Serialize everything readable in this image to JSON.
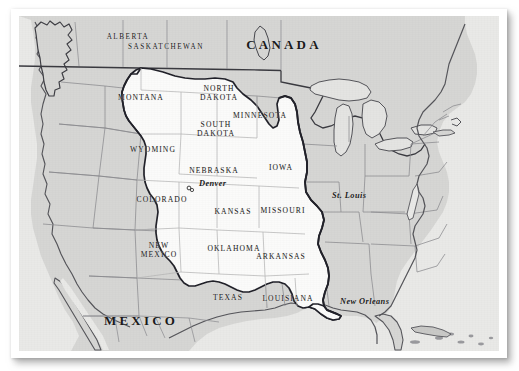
{
  "map": {
    "subject": "Louisiana Purchase territory in North America",
    "colors": {
      "page_background": "#ffffff",
      "frame": "#ffffff",
      "land_base": "#d6d6d4",
      "purchase_territory": "#fbfbfa",
      "ocean": "#e9e9e7",
      "coastline": "#55555a",
      "state_border": "#8b8b8f",
      "purchase_boundary": "#22222a",
      "label_text": "#1b1b1b"
    },
    "countries": [
      {
        "name": "CANADA",
        "x": 273,
        "y": 36
      },
      {
        "name": "MEXICO",
        "x": 130,
        "y": 312
      }
    ],
    "provinces": [
      {
        "name": "ALBERTA",
        "x": 117,
        "y": 28
      },
      {
        "name": "SASKATCHEWAN",
        "x": 155,
        "y": 38
      }
    ],
    "states": [
      {
        "name": "MONTANA",
        "lines": [
          "MONTANA"
        ],
        "x": 130,
        "y": 88
      },
      {
        "name": "NORTH DAKOTA",
        "lines": [
          "NORTH",
          "DAKOTA"
        ],
        "x": 208,
        "y": 84
      },
      {
        "name": "MINNESOTA",
        "lines": [
          "MINNESOTA"
        ],
        "x": 249,
        "y": 106
      },
      {
        "name": "SOUTH DAKOTA",
        "lines": [
          "SOUTH",
          "DAKOTA"
        ],
        "x": 205,
        "y": 120
      },
      {
        "name": "WYOMING",
        "lines": [
          "WYOMING"
        ],
        "x": 142,
        "y": 140
      },
      {
        "name": "NEBRASKA",
        "lines": [
          "NEBRASKA"
        ],
        "x": 203,
        "y": 161
      },
      {
        "name": "IOWA",
        "lines": [
          "IOWA"
        ],
        "x": 270,
        "y": 158
      },
      {
        "name": "COLORADO",
        "lines": [
          "COLORADO"
        ],
        "x": 151,
        "y": 190
      },
      {
        "name": "KANSAS",
        "lines": [
          "KANSAS"
        ],
        "x": 222,
        "y": 202
      },
      {
        "name": "MISSOURI",
        "lines": [
          "MISSOURI"
        ],
        "x": 272,
        "y": 201
      },
      {
        "name": "NEW MEXICO",
        "lines": [
          "NEW",
          "MEXICO"
        ],
        "x": 148,
        "y": 241
      },
      {
        "name": "OKLAHOMA",
        "lines": [
          "OKLAHOMA"
        ],
        "x": 223,
        "y": 239
      },
      {
        "name": "ARKANSAS",
        "lines": [
          "ARKANSAS"
        ],
        "x": 270,
        "y": 247
      },
      {
        "name": "TEXAS",
        "lines": [
          "TEXAS"
        ],
        "x": 217,
        "y": 288
      },
      {
        "name": "LOUISIANA",
        "lines": [
          "LOUISIANA"
        ],
        "x": 277,
        "y": 289
      }
    ],
    "cities": [
      {
        "name": "Denver",
        "x": 181,
        "y": 181,
        "label_dx": 7,
        "label_dy": -7,
        "has_dot": true
      },
      {
        "name": "St. Louis",
        "x": 317,
        "y": 192,
        "label_dx": 4,
        "label_dy": -6,
        "has_dot": false
      },
      {
        "name": "New Orleans",
        "x": 325,
        "y": 297,
        "label_dx": 4,
        "label_dy": -5,
        "has_dot": false
      }
    ]
  }
}
